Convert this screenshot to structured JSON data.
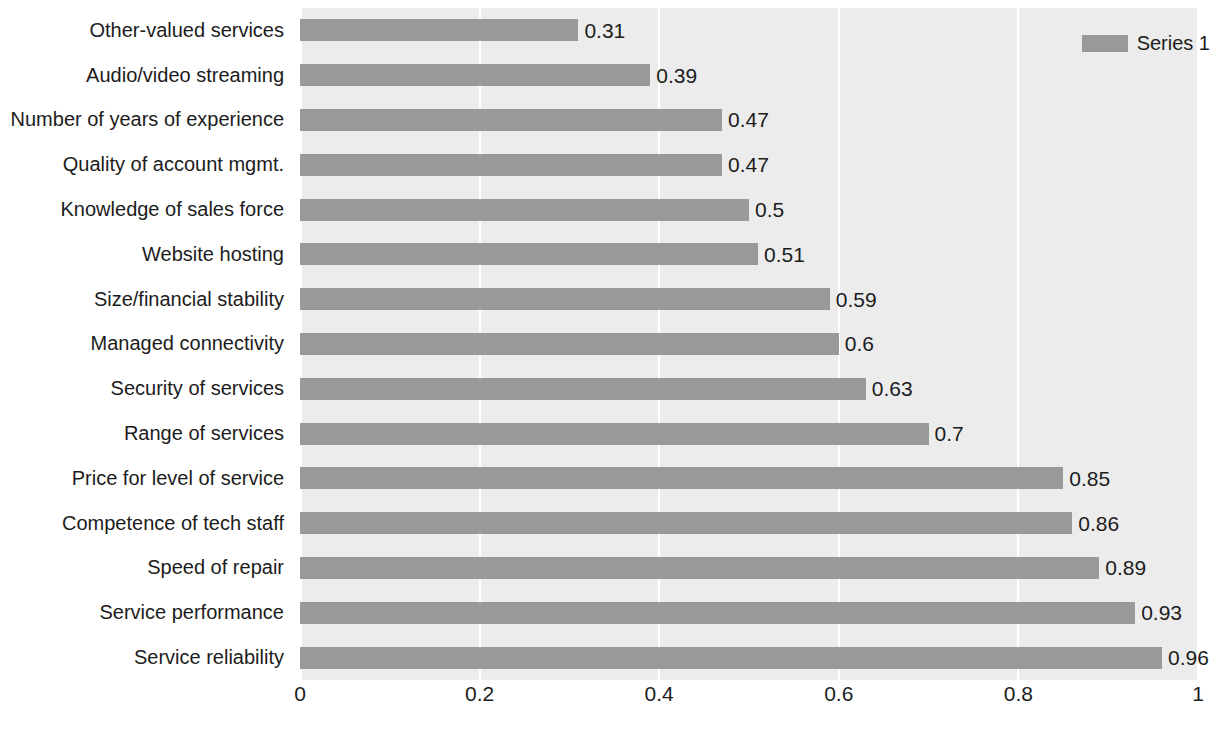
{
  "chart_data": {
    "type": "bar",
    "orientation": "horizontal",
    "title": "",
    "xlabel": "",
    "ylabel": "",
    "xlim": [
      0,
      1
    ],
    "grid": true,
    "gridlines_x": [
      0,
      0.2,
      0.4,
      0.6,
      0.8,
      1
    ],
    "xticks": [
      "0",
      "0.2",
      "0.4",
      "0.6",
      "0.8",
      "1"
    ],
    "legend": {
      "position": "top-right",
      "entries": [
        "Series 1"
      ]
    },
    "categories": [
      "Other-valued services",
      "Audio/video streaming",
      "Number of years of experience",
      "Quality of account mgmt.",
      "Knowledge of sales force",
      "Website hosting",
      "Size/financial stability",
      "Managed connectivity",
      "Security of services",
      "Range of services",
      "Price for level of service",
      "Competence of tech staff",
      "Speed of repair",
      "Service performance",
      "Service reliability"
    ],
    "series": [
      {
        "name": "Series 1",
        "values": [
          0.31,
          0.39,
          0.47,
          0.47,
          0.5,
          0.51,
          0.59,
          0.6,
          0.63,
          0.7,
          0.85,
          0.86,
          0.89,
          0.93,
          0.96
        ],
        "labels": [
          "0.31",
          "0.39",
          "0.47",
          "0.47",
          "0.5",
          "0.51",
          "0.59",
          "0.6",
          "0.63",
          "0.7",
          "0.85",
          "0.86",
          "0.89",
          "0.93",
          "0.96"
        ],
        "color": "#999999"
      }
    ],
    "colors": {
      "bar": "#999999",
      "plot_background": "#ececec",
      "figure_background": "#ffffff",
      "gridline": "#ffffff",
      "text": "#1c1c1c"
    }
  }
}
